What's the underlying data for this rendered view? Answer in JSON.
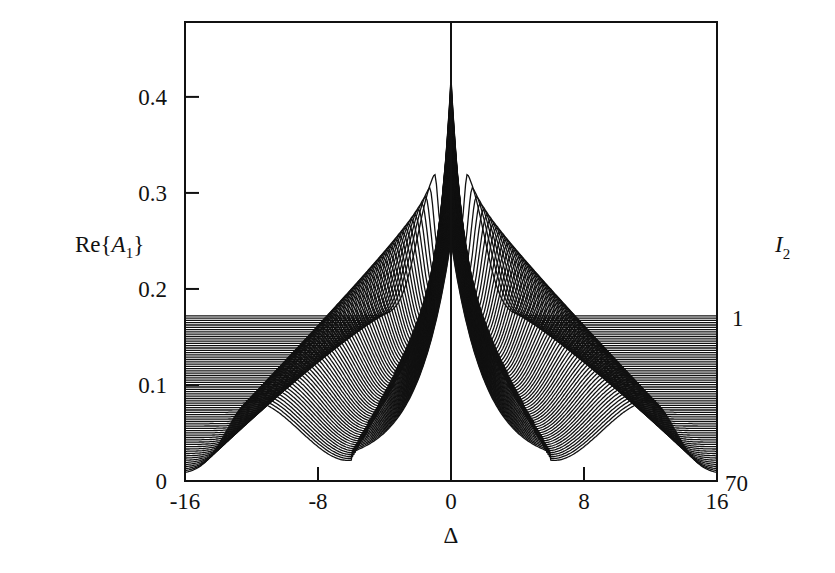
{
  "chart_data": {
    "type": "line",
    "title": "",
    "xlabel": "Δ",
    "ylabel": "Re{A₁}",
    "ylabel_parts": {
      "prefix": "Re{",
      "var": "A",
      "sub": "1",
      "suffix": "}"
    },
    "right_label_parts": {
      "var": "I",
      "sub": "2"
    },
    "xlim": [
      -16,
      16
    ],
    "ylim": [
      0,
      0.478
    ],
    "x_ticks": [
      -16,
      -8,
      0,
      8,
      16
    ],
    "x_tick_labels": [
      "-16",
      "-8",
      "0",
      "8",
      "16"
    ],
    "y_ticks": [
      0,
      0.1,
      0.2,
      0.3,
      0.4
    ],
    "y_tick_labels": [
      "0",
      "0.1",
      "0.2",
      "0.3",
      "0.4"
    ],
    "grid": false,
    "legend": "none",
    "vertical_line_at_x": 0,
    "family_parameter": "I₂",
    "family_range_labels": {
      "top": "1",
      "bottom": "70"
    },
    "n_curves": 70,
    "curve_model": {
      "edge_value_range": [
        0.172,
        0.007
      ],
      "center_peak_range": [
        0.42,
        0.25
      ],
      "hump_position_range": [
        1.0,
        12.0
      ],
      "hump_height_range": [
        0.3,
        0.083
      ],
      "dip_value_range": [
        0.17,
        0.018
      ]
    },
    "series": [
      {
        "name": "I₂=1",
        "x": [
          -16,
          -12,
          -8,
          -4,
          -2,
          0,
          2,
          4,
          8,
          12,
          16
        ],
        "values": [
          0.172,
          0.172,
          0.172,
          0.2,
          0.27,
          0.42,
          0.27,
          0.2,
          0.172,
          0.172,
          0.172
        ]
      },
      {
        "name": "I₂=20",
        "x": [
          -16,
          -12,
          -8,
          -6,
          -4,
          -2,
          0,
          2,
          4,
          6,
          8,
          12,
          16
        ],
        "values": [
          0.152,
          0.152,
          0.155,
          0.19,
          0.2,
          0.22,
          0.36,
          0.22,
          0.2,
          0.19,
          0.155,
          0.152,
          0.152
        ]
      },
      {
        "name": "I₂=40",
        "x": [
          -16,
          -12,
          -9,
          -6,
          -3,
          -1,
          0,
          1,
          3,
          6,
          9,
          12,
          16
        ],
        "values": [
          0.105,
          0.11,
          0.14,
          0.11,
          0.1,
          0.2,
          0.31,
          0.2,
          0.1,
          0.11,
          0.14,
          0.11,
          0.105
        ]
      },
      {
        "name": "I₂=70",
        "x": [
          -16,
          -14,
          -12,
          -10,
          -6,
          -3,
          -1,
          0,
          1,
          3,
          6,
          10,
          12,
          14,
          16
        ],
        "values": [
          0.007,
          0.03,
          0.083,
          0.05,
          0.018,
          0.04,
          0.15,
          0.25,
          0.15,
          0.04,
          0.018,
          0.05,
          0.083,
          0.03,
          0.007
        ]
      }
    ]
  },
  "layout": {
    "plot_left": 185,
    "plot_right": 717,
    "plot_top": 22,
    "plot_bottom": 481,
    "line_color": "#111111"
  }
}
